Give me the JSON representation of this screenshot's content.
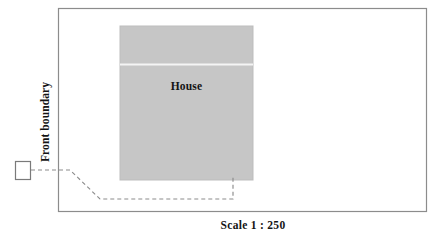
{
  "diagram": {
    "title_text": "Scale 1 : 250",
    "labels": {
      "house": "House",
      "front_boundary": "Front boundary",
      "scale": "Scale 1 : 250"
    },
    "colors": {
      "page_background": "#ffffff",
      "boundary_stroke": "#8c8c8c",
      "house_fill": "#c6c6c6",
      "house_stroke": "#bdbdbd",
      "house_divider": "#f2f2f2",
      "driveway_stroke": "#8c8c8c",
      "gate_stroke": "#7a7a7a",
      "text": "#141414"
    },
    "geometry": {
      "plot_boundary": {
        "x": 58,
        "y": 8,
        "width": 369,
        "height": 204
      },
      "house": {
        "x": 120,
        "y": 26,
        "width": 133,
        "height": 154
      },
      "house_divider_y": 64,
      "gate_box": {
        "x": 15,
        "y": 161,
        "width": 16,
        "height": 19
      },
      "driveway_path": [
        {
          "x": 31,
          "y": 170
        },
        {
          "x": 70,
          "y": 170
        },
        {
          "x": 100,
          "y": 199
        },
        {
          "x": 233,
          "y": 199
        },
        {
          "x": 233,
          "y": 175
        }
      ]
    }
  }
}
